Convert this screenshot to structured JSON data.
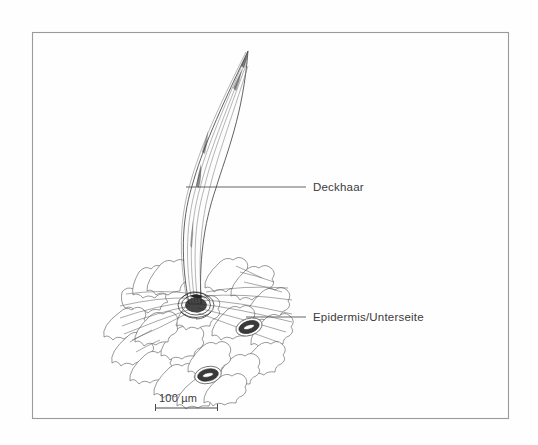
{
  "figure": {
    "background_color": "#fefefe",
    "frame": {
      "stroke_color": "#9a9a9a",
      "x": 32,
      "y": 32,
      "width": 476,
      "height": 386
    },
    "ink_color": "#4a4a4a",
    "text_color": "#3b3b3b"
  },
  "labels": [
    {
      "id": "deckhaar",
      "text": "Deckhaar",
      "text_x": 313,
      "text_y": 191,
      "leader_x1": 186,
      "leader_x2": 306,
      "leader_y": 187
    },
    {
      "id": "epidermis",
      "text": "Epidermis/Unterseite",
      "text_x": 313,
      "text_y": 321,
      "leader_x1": 246,
      "leader_x2": 306,
      "leader_y": 317
    }
  ],
  "scale_bar": {
    "text": "100 µm",
    "value": 100,
    "unit": "µm",
    "text_x": 159,
    "text_y": 402,
    "bar_x1": 155,
    "bar_x2": 218,
    "bar_y": 408,
    "tick_height": 5
  },
  "structures": {
    "trichome": {
      "name": "Deckhaar",
      "tip_x": 248,
      "tip_y": 50,
      "base_x": 196,
      "base_y": 305
    },
    "epidermis_patch": {
      "name": "Epidermis/Unterseite",
      "cell_type": "jigsaw pavement cells",
      "bounds": {
        "x": 114,
        "y": 256,
        "width": 178,
        "height": 136
      }
    },
    "stomata": [
      {
        "cx": 249,
        "cy": 327,
        "rx": 12,
        "ry": 7,
        "angle": -18
      },
      {
        "cx": 208,
        "cy": 375,
        "rx": 12,
        "ry": 7,
        "angle": -12
      }
    ]
  }
}
